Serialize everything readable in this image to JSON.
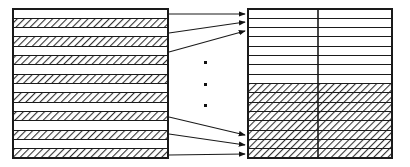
{
  "diagram": {
    "type": "block-mapping-diagram",
    "canvas": {
      "width": 410,
      "height": 167,
      "background": "#ffffff"
    },
    "stroke_color": "#1a1a1a",
    "hatch_color": "#3a3a3a",
    "fill_color": "#ffffff",
    "left_block": {
      "name": "left-block",
      "label": "",
      "x": 13,
      "y": 9,
      "width": 155,
      "height": 149,
      "border_width": 2,
      "row_count": 15,
      "row_pattern": [
        "plain",
        "hatched",
        "plain",
        "hatched",
        "plain",
        "hatched",
        "plain",
        "hatched",
        "plain",
        "hatched",
        "plain",
        "hatched",
        "plain",
        "hatched",
        "hatched"
      ],
      "rows": [
        {
          "index": 0,
          "fill": "plain"
        },
        {
          "index": 1,
          "fill": "hatched"
        },
        {
          "index": 2,
          "fill": "plain"
        },
        {
          "index": 3,
          "fill": "hatched"
        },
        {
          "index": 4,
          "fill": "plain"
        },
        {
          "index": 5,
          "fill": "hatched"
        },
        {
          "index": 6,
          "fill": "plain"
        },
        {
          "index": 7,
          "fill": "hatched"
        },
        {
          "index": 8,
          "fill": "plain"
        },
        {
          "index": 9,
          "fill": "hatched"
        },
        {
          "index": 10,
          "fill": "plain"
        },
        {
          "index": 11,
          "fill": "hatched"
        },
        {
          "index": 12,
          "fill": "plain"
        },
        {
          "index": 13,
          "fill": "hatched"
        },
        {
          "index": 14,
          "fill": "plain"
        },
        {
          "index": 15,
          "fill": "hatched"
        }
      ]
    },
    "right_block": {
      "name": "right-block",
      "label": "",
      "x": 248,
      "y": 9,
      "width": 144,
      "height": 149,
      "border_width": 2,
      "divider_x": 318,
      "column_count": 2,
      "row_count": 16,
      "plain_row_count": 8,
      "hatched_row_count": 8,
      "rows": [
        {
          "index": 0,
          "fill": "plain"
        },
        {
          "index": 1,
          "fill": "plain"
        },
        {
          "index": 2,
          "fill": "plain"
        },
        {
          "index": 3,
          "fill": "plain"
        },
        {
          "index": 4,
          "fill": "plain"
        },
        {
          "index": 5,
          "fill": "plain"
        },
        {
          "index": 6,
          "fill": "plain"
        },
        {
          "index": 7,
          "fill": "plain"
        },
        {
          "index": 8,
          "fill": "hatched"
        },
        {
          "index": 9,
          "fill": "hatched"
        },
        {
          "index": 10,
          "fill": "hatched"
        },
        {
          "index": 11,
          "fill": "hatched"
        },
        {
          "index": 12,
          "fill": "hatched"
        },
        {
          "index": 13,
          "fill": "hatched"
        },
        {
          "index": 14,
          "fill": "hatched"
        },
        {
          "index": 15,
          "fill": "hatched"
        }
      ]
    },
    "arrows": [
      {
        "name": "arrow-top-1",
        "x1": 169,
        "y1": 14,
        "x2": 245,
        "y2": 14
      },
      {
        "name": "arrow-top-2",
        "x1": 169,
        "y1": 33,
        "x2": 245,
        "y2": 22
      },
      {
        "name": "arrow-top-3",
        "x1": 169,
        "y1": 52,
        "x2": 245,
        "y2": 31
      },
      {
        "name": "arrow-bottom-1",
        "x1": 169,
        "y1": 117,
        "x2": 245,
        "y2": 135
      },
      {
        "name": "arrow-bottom-2",
        "x1": 169,
        "y1": 134,
        "x2": 245,
        "y2": 145
      },
      {
        "name": "arrow-bottom-3",
        "x1": 169,
        "y1": 155,
        "x2": 245,
        "y2": 154
      }
    ],
    "ellipsis": {
      "name": "vertical-ellipsis",
      "symbol": "dot",
      "count": 3,
      "x": 205,
      "dot_size": 3,
      "dots_y": [
        62,
        84,
        105
      ]
    }
  }
}
